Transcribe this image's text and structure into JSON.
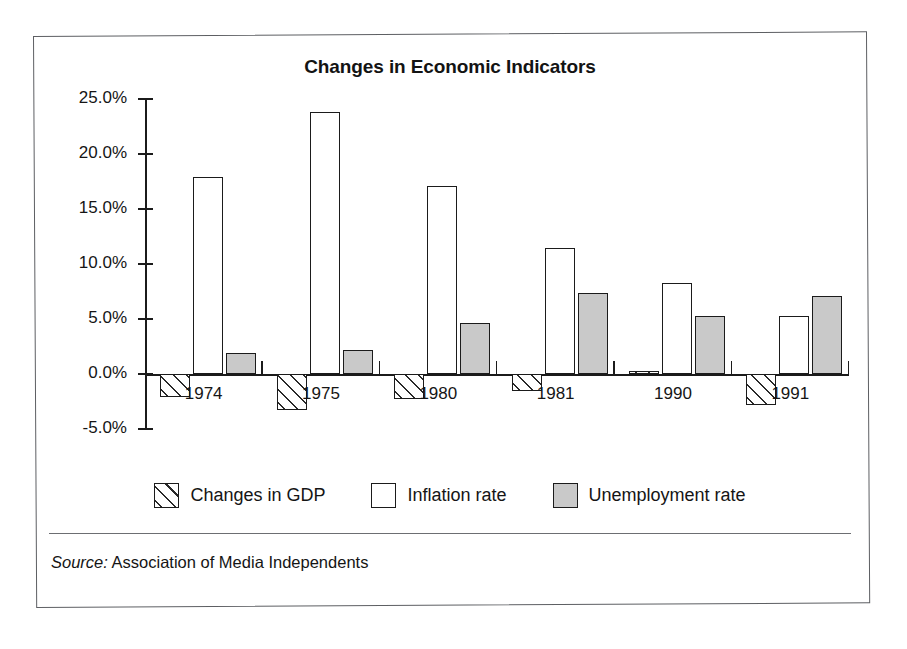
{
  "figure": {
    "title": "Changes in Economic Indicators",
    "source_label": "Source:",
    "source_text": "Association of Media Independents"
  },
  "legend": {
    "position": "bottom-center",
    "items": [
      {
        "label": "Changes in GDP",
        "swatch": "hatched-diagonal",
        "color": "#ffffff"
      },
      {
        "label": "Inflation rate",
        "swatch": "outline-white",
        "color": "#ffffff"
      },
      {
        "label": "Unemployment rate",
        "swatch": "filled-gray",
        "color": "#c9c9c9"
      }
    ]
  },
  "axes": {
    "y_ticks": [
      "25.0%",
      "20.0%",
      "15.0%",
      "10.0%",
      "5.0%",
      "0.0%",
      "-5.0%"
    ],
    "x_ticks": [
      "1974",
      "1975",
      "1980",
      "1981",
      "1990",
      "1991"
    ]
  },
  "chart_data": {
    "type": "bar",
    "title": "Changes in Economic Indicators",
    "xlabel": "",
    "ylabel": "",
    "ylim": [
      -5,
      25
    ],
    "ytick_step": 5,
    "ytick_format": "percent",
    "grid": false,
    "legend_position": "bottom-center",
    "categories": [
      "1974",
      "1975",
      "1980",
      "1981",
      "1990",
      "1991"
    ],
    "series": [
      {
        "name": "Changes in GDP",
        "style": "hatched-diagonal",
        "values": [
          -2.1,
          -3.3,
          -2.3,
          -1.5,
          0.3,
          -2.8
        ]
      },
      {
        "name": "Inflation rate",
        "style": "outline-white",
        "values": [
          17.9,
          23.8,
          17.1,
          11.5,
          8.3,
          5.3
        ]
      },
      {
        "name": "Unemployment rate",
        "style": "filled-gray",
        "values": [
          1.9,
          2.2,
          4.6,
          7.4,
          5.3,
          7.1
        ]
      }
    ],
    "source": "Source: Association of Media Independents"
  }
}
